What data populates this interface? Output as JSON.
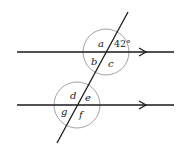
{
  "diagram": {
    "colors": {
      "line": "#1a1a1a",
      "arc": "#8a8a8a",
      "background": "#ffffff"
    },
    "parallel_lines": [
      {
        "id": "top",
        "y": 52,
        "x1": 17,
        "x2": 174,
        "arrow_x": 145
      },
      {
        "id": "bottom",
        "y": 105,
        "x1": 17,
        "x2": 174,
        "arrow_x": 145
      }
    ],
    "transversal": {
      "x1": 128,
      "y1": 12,
      "x2": 57,
      "y2": 143
    },
    "intersections": [
      {
        "id": "top",
        "cx": 106,
        "cy": 52,
        "r": 23
      },
      {
        "id": "bottom",
        "cx": 77,
        "cy": 105,
        "r": 23
      }
    ],
    "angle_labels": {
      "a": "a",
      "given": "42°",
      "b": "b",
      "c": "c",
      "d": "d",
      "e": "e",
      "f": "f",
      "g": "g"
    }
  }
}
